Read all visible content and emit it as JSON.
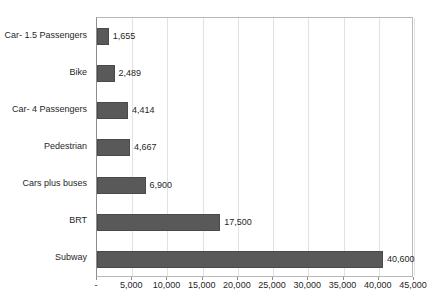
{
  "chart_data": {
    "type": "bar",
    "orientation": "horizontal",
    "title": "",
    "subtitle": "",
    "xlabel": "",
    "ylabel": "",
    "categories": [
      "Car- 1.5 Passengers",
      "Bike",
      "Car- 4 Passengers",
      "Pedestrian",
      "Cars plus buses",
      "BRT",
      "Subway"
    ],
    "values": [
      1655,
      2489,
      4414,
      4667,
      6900,
      17500,
      40600
    ],
    "data_labels": [
      "1,655",
      "2,489",
      "4,414",
      "4,667",
      "6,900",
      "17,500",
      "40,600"
    ],
    "xlim": [
      0,
      45000
    ],
    "xtick_values": [
      0,
      5000,
      10000,
      15000,
      20000,
      25000,
      30000,
      35000,
      40000,
      45000
    ],
    "xtick_labels": [
      "-",
      "5,000",
      "10,000",
      "15,000",
      "20,000",
      "25,000",
      "30,000",
      "35,000",
      "40,000",
      "45,000"
    ],
    "grid": "vertical",
    "legend": "none",
    "bar_color": "#595959",
    "gridline_color": "#e2e2e2",
    "axis_color": "#8d8d8d",
    "plot_border_color": "#b8b8b8",
    "text_color": "#1f1f1f"
  }
}
